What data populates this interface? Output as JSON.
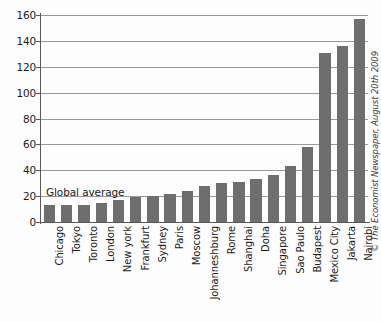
{
  "credit": "© The Economist Newspaper, August 20th 2009",
  "annotation": "Global average",
  "colors": {
    "bar": "#6e6e6e",
    "grid": "#9a9a9a",
    "axis": "#5a5a5a",
    "text": "#1c1c1c",
    "background": "#fdfdfd"
  },
  "chart_data": {
    "type": "bar",
    "title": "",
    "xlabel": "",
    "ylabel": "",
    "ylim": [
      0,
      160
    ],
    "ytick_step": 20,
    "yticks": [
      0,
      20,
      40,
      60,
      80,
      100,
      120,
      140,
      160
    ],
    "grid": true,
    "legend": "none",
    "orientation": "vertical",
    "categories": [
      "Chicago",
      "Tokyo",
      "Toronto",
      "London",
      "New york",
      "Frankfurt",
      "Sydney",
      "Paris",
      "Moscow",
      "Johanneshburg",
      "Rome",
      "Shanghai",
      "Doha",
      "Singapore",
      "Sao Paulo",
      "Budapest",
      "Mexico City",
      "Jakarta",
      "Nairobi"
    ],
    "values": [
      13,
      13,
      13,
      15,
      17,
      19,
      20,
      22,
      24,
      28,
      30,
      31,
      33,
      36,
      43,
      58,
      131,
      136,
      157
    ],
    "annotations": [
      {
        "text": "Global average",
        "value": 20
      }
    ]
  }
}
